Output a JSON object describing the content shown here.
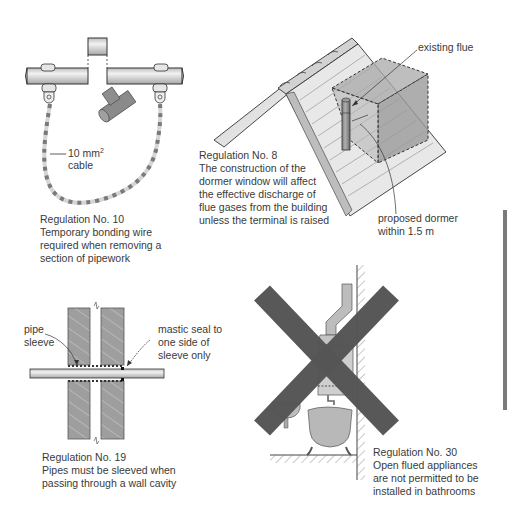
{
  "panels": [
    {
      "id": "reg10",
      "caption": {
        "title": "Regulation No. 10",
        "lines": [
          "Temporary bonding wire",
          "required when removing a",
          "section of pipework"
        ]
      },
      "labels": {
        "cable_size": "10 mm",
        "cable_size_sup": "2",
        "cable_word": "cable"
      }
    },
    {
      "id": "reg8",
      "caption": {
        "title": "Regulation No. 8",
        "lines": [
          "The construction of the",
          "dormer window will affect",
          "the effective discharge of",
          "flue gases from the building",
          "unless the terminal is raised"
        ]
      },
      "labels": {
        "existing_flue": "existing flue",
        "dormer_line1": "proposed dormer",
        "dormer_line2": "within 1.5 m"
      }
    },
    {
      "id": "reg19",
      "caption": {
        "title": "Regulation No. 19",
        "lines": [
          "Pipes must be sleeved when",
          "passing through a wall cavity"
        ]
      },
      "labels": {
        "pipe_sleeve_1": "pipe",
        "pipe_sleeve_2": "sleeve",
        "mastic_1": "mastic seal to",
        "mastic_2": "one side of",
        "mastic_3": "sleeve only"
      }
    },
    {
      "id": "reg30",
      "caption": {
        "title": "Regulation No. 30",
        "lines": [
          "Open flued appliances",
          "are not permitted to be",
          "installed in bathrooms"
        ]
      }
    }
  ],
  "colors": {
    "line": "#333333",
    "fill_light": "#d8d8d8",
    "fill_mid": "#9a9a9a",
    "fill_dark": "#6e6e6e",
    "cross": "#555555",
    "cable_stripe": "#7a7a7a",
    "side_tab": "#7a7a7a"
  }
}
